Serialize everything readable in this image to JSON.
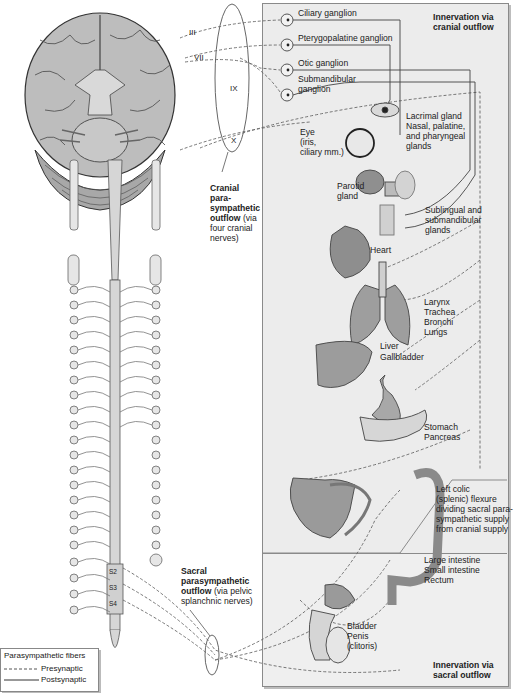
{
  "cranial_nerves": [
    "III",
    "VII",
    "IX",
    "X"
  ],
  "ganglia": [
    {
      "label": "Ciliary ganglion"
    },
    {
      "label": "Pterygopalatine ganglion"
    },
    {
      "label": "Otic ganglion"
    },
    {
      "label": "Submandibular\nganglion",
      "line1": "Submandibular",
      "line2": "ganglion"
    }
  ],
  "panel_headers": {
    "cranial": {
      "line1": "Innervation via",
      "line2": "cranial outflow"
    },
    "sacral": {
      "line1": "Innervation via",
      "line2": "sacral outflow"
    }
  },
  "targets": {
    "eye": {
      "line1": "Eye",
      "line2": "(iris,",
      "line3": "ciliary mm.)"
    },
    "lacrimal": {
      "line1": "Lacrimal gland",
      "line2": "Nasal, palatine,",
      "line3": "and pharyngeal",
      "line4": "glands"
    },
    "parotid": {
      "line1": "Parotid",
      "line2": "gland"
    },
    "sublingual": {
      "line1": "Sublingual and",
      "line2": "submandibular",
      "line3": "glands"
    },
    "heart": {
      "line1": "Heart"
    },
    "respiratory": {
      "line1": "Larynx",
      "line2": "Trachea",
      "line3": "Bronchi",
      "line4": "Lungs"
    },
    "liver": {
      "line1": "Liver",
      "line2": "Gallbladder"
    },
    "stomach": {
      "line1": "Stomach",
      "line2": "Pancreas"
    },
    "colic_flexure": {
      "line1": "Left colic",
      "line2": "(splenic) flexure",
      "line3": "dividing sacral para-",
      "line4": "sympathetic supply",
      "line5": "from cranial supply"
    },
    "intestine": {
      "line1": "Large intestine",
      "line2": "Small intestine",
      "line3": "Rectum"
    },
    "pelvic": {
      "line1": "Bladder",
      "line2": "Penis",
      "line3": "(clitoris)"
    }
  },
  "outflow_labels": {
    "cranial": {
      "b1": "Cranial",
      "b2": "para-",
      "b3": "sympathetic",
      "b4": "outflow",
      "n4": " (via",
      "n5": "four cranial",
      "n6": "nerves)"
    },
    "sacral": {
      "b1": "Sacral",
      "b2": "parasympathetic",
      "b3": "outflow",
      "n3": " (via pelvic",
      "n4": "splanchnic nerves)"
    }
  },
  "spinal_segments": [
    "S2",
    "S3",
    "S4"
  ],
  "legend": {
    "title": "Parasympathetic fibers",
    "items": [
      {
        "label": "Presynaptic",
        "style": "dashed"
      },
      {
        "label": "Postsynaptic",
        "style": "solid"
      }
    ]
  },
  "colors": {
    "panel_bg": "#ececec",
    "line": "#555555",
    "organ": "#9a9a9a",
    "brain": "#bdbdbd"
  }
}
